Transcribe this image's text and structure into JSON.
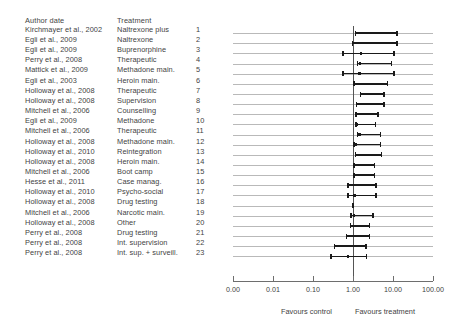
{
  "headers": {
    "author": "Author date",
    "treatment": "Treatment"
  },
  "axis": {
    "tick_labels": [
      "0.00",
      "0.01",
      "0.10",
      "1.00",
      "10.00",
      "100.00"
    ],
    "tick_values": [
      0.0,
      0.01,
      0.1,
      1.0,
      10.0,
      100.0
    ],
    "favours_control": "Favours control",
    "favours_treatment": "Favours treatment",
    "null_value": 1.0
  },
  "chart_data": {
    "type": "forest",
    "title": "",
    "xlabel": "",
    "ylabel": "",
    "xscale": "log",
    "xlim": [
      0.001,
      100.0
    ],
    "xticks": [
      0.001,
      0.01,
      0.1,
      1.0,
      10.0,
      100.0
    ],
    "xticklabels": [
      "0.00",
      "0.01",
      "0.10",
      "1.00",
      "10.00",
      "100.00"
    ],
    "null_line": 1.0,
    "grid": true,
    "legend": "none",
    "left_annotation": "Favours control",
    "right_annotation": "Favours treatment",
    "columns": [
      "Author date",
      "Treatment",
      "#"
    ],
    "rows": [
      {
        "index": 1,
        "author": "Kirchmayer et al., 2002",
        "treatment": "Naltrexone plus",
        "estimate": 2.4,
        "ci_low": 1.1,
        "ci_high": 13.0
      },
      {
        "index": 2,
        "author": "Egli et al., 2009",
        "treatment": "Naltrexone",
        "estimate": 2.2,
        "ci_low": 0.92,
        "ci_high": 13.0
      },
      {
        "index": 3,
        "author": "Egli et al., 2009",
        "treatment": "Buprenorphine",
        "estimate": 1.6,
        "ci_low": 0.53,
        "ci_high": 11.0
      },
      {
        "index": 4,
        "author": "Perry et al., 2008",
        "treatment": "Therapeutic",
        "estimate": 1.5,
        "ci_low": 1.25,
        "ci_high": 9.5
      },
      {
        "index": 5,
        "author": "Mattick et al., 2009",
        "treatment": "Methadone main.",
        "estimate": 1.45,
        "ci_low": 0.53,
        "ci_high": 11.0
      },
      {
        "index": 6,
        "author": "Egli et al., 2003",
        "treatment": "Heroin main.",
        "estimate": 1.55,
        "ci_low": 1.0,
        "ci_high": 7.6
      },
      {
        "index": 7,
        "author": "Holloway et al., 2008",
        "treatment": "Therapeutic",
        "estimate": 1.6,
        "ci_low": 1.45,
        "ci_high": 6.3
      },
      {
        "index": 8,
        "author": "Holloway et al., 2008",
        "treatment": "Supervision",
        "estimate": 1.35,
        "ci_low": 1.18,
        "ci_high": 6.3
      },
      {
        "index": 9,
        "author": "Mitchell et al., 2006",
        "treatment": "Counselling",
        "estimate": 1.3,
        "ci_low": 1.12,
        "ci_high": 4.4
      },
      {
        "index": 10,
        "author": "Egli et al., 2009",
        "treatment": "Methadone",
        "estimate": 1.25,
        "ci_low": 1.12,
        "ci_high": 3.8
      },
      {
        "index": 11,
        "author": "Mitchell et al., 2006",
        "treatment": "Therapeutic",
        "estimate": 1.45,
        "ci_low": 1.25,
        "ci_high": 5.1
      },
      {
        "index": 12,
        "author": "Holloway et al., 2008",
        "treatment": "Methadone main.",
        "estimate": 1.2,
        "ci_low": 1.02,
        "ci_high": 5.1
      },
      {
        "index": 13,
        "author": "Holloway et al., 2010",
        "treatment": "Reintegration",
        "estimate": 1.32,
        "ci_low": 1.1,
        "ci_high": 5.4
      },
      {
        "index": 14,
        "author": "Holloway et al., 2008",
        "treatment": "Heroin main.",
        "estimate": 1.18,
        "ci_low": 1.02,
        "ci_high": 3.6
      },
      {
        "index": 15,
        "author": "Mitchell et al., 2006",
        "treatment": "Boot camp",
        "estimate": 1.15,
        "ci_low": 1.0,
        "ci_high": 3.6
      },
      {
        "index": 16,
        "author": "Hesse et al., 2011",
        "treatment": "Case manag.",
        "estimate": 1.12,
        "ci_low": 0.72,
        "ci_high": 3.9
      },
      {
        "index": 17,
        "author": "Holloway et al., 2010",
        "treatment": "Psycho-social",
        "estimate": 1.1,
        "ci_low": 0.72,
        "ci_high": 3.9
      },
      {
        "index": 18,
        "author": "Holloway et al., 2008",
        "treatment": "Drug testing",
        "estimate": 1.0,
        "ci_low": 0.98,
        "ci_high": 1.02
      },
      {
        "index": 19,
        "author": "Mitchell et al., 2006",
        "treatment": "Narcotic main.",
        "estimate": 1.05,
        "ci_low": 0.86,
        "ci_high": 3.3
      },
      {
        "index": 20,
        "author": "Holloway et al., 2008",
        "treatment": "Other",
        "estimate": 1.0,
        "ci_low": 0.82,
        "ci_high": 2.7
      },
      {
        "index": 21,
        "author": "Perry et al., 2008",
        "treatment": "Drug testing",
        "estimate": 0.92,
        "ci_low": 0.66,
        "ci_high": 2.7
      },
      {
        "index": 22,
        "author": "Perry et al., 2008",
        "treatment": "Int. supervision",
        "estimate": 0.72,
        "ci_low": 0.33,
        "ci_high": 2.2
      },
      {
        "index": 23,
        "author": "Perry et al., 2008",
        "treatment": "Int. sup. + surveill.",
        "estimate": 0.76,
        "ci_low": 0.27,
        "ci_high": 2.3
      }
    ]
  }
}
